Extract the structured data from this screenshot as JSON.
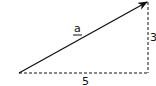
{
  "diagram": {
    "type": "vector-right-triangle",
    "vector": {
      "label": "a",
      "label_style": "underlined",
      "from": [
        0,
        0
      ],
      "to": [
        5,
        3
      ]
    },
    "horizontal_component": {
      "label": "5",
      "style": "dashed"
    },
    "vertical_component": {
      "label": "3",
      "style": "dashed"
    },
    "colors": {
      "stroke": "#111111",
      "background": "#ffffff"
    }
  }
}
